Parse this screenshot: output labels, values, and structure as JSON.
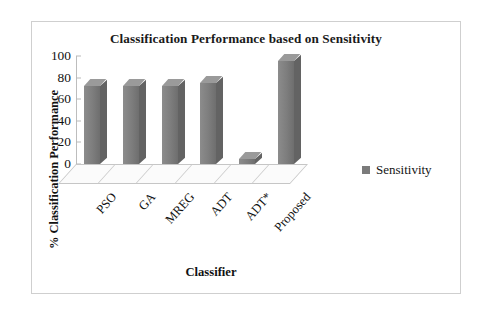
{
  "chart_data": {
    "type": "bar",
    "title": "Classification Performance based on Sensitivity",
    "xlabel": "Classifier",
    "ylabel": "% Classification Performance",
    "categories": [
      "PSO",
      "GA",
      "MREG",
      "ADT",
      "ADT*",
      "Proposed"
    ],
    "series": [
      {
        "name": "Sensitivity",
        "values": [
          72,
          72,
          72,
          75,
          5,
          95
        ],
        "color": "#7b7b7b"
      }
    ],
    "ylim": [
      0,
      100
    ],
    "yticks": [
      0,
      20,
      40,
      60,
      80,
      100
    ],
    "ytick_labels": [
      "0",
      "20",
      "40",
      "60",
      "80",
      "100"
    ],
    "grid": false,
    "legend_position": "right",
    "style": "3d-column"
  },
  "legend": {
    "entries": [
      {
        "label": "Sensitivity",
        "swatch_color": "#7b7b7b"
      }
    ]
  },
  "icons": {
    "legend_swatch": "square-swatch-icon"
  }
}
